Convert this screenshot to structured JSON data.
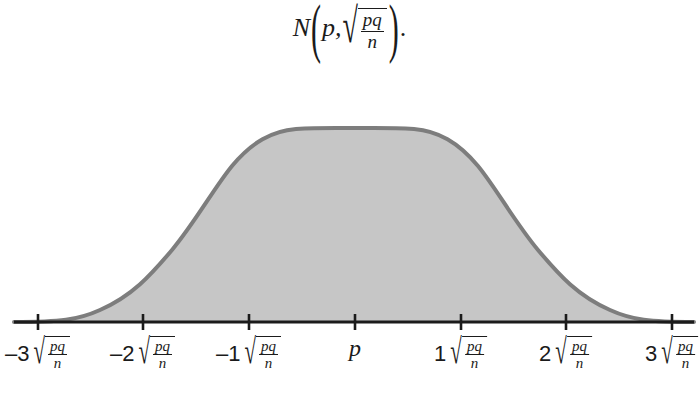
{
  "figure": {
    "background_color": "#ffffff",
    "title": {
      "name": "normal-distribution-notation",
      "text": "N(p, sqrt(pq/n)).",
      "parts": {
        "dist_symbol": "N",
        "open_paren": "(",
        "mean": "p",
        "comma": ",",
        "radical": "√",
        "sd_numerator": "pq",
        "sd_denominator": "n",
        "close_paren": ")",
        "period": "."
      }
    }
  },
  "chart_data": {
    "type": "area",
    "xlabel": "",
    "ylabel": "",
    "grid": false,
    "legend": null,
    "curve": {
      "name": "normal-density-curve",
      "distribution": "normal",
      "mean_label": "p",
      "sd_label": "√(pq/n)",
      "stroke_color": "#7d7d7d",
      "fill_color": "#c6c6c6",
      "stroke_width": 4,
      "peak_x_px": 355,
      "peak_y_px": 129,
      "baseline_y_px": 322
    },
    "axis": {
      "name": "horizontal-axis",
      "color": "#1b1b1b",
      "y_px": 322,
      "x_start_px": 14,
      "x_end_px": 694,
      "tick_half_height_px": 8
    },
    "x": [
      -3,
      -2,
      -1,
      0,
      1,
      2,
      3
    ],
    "tick_positions_px": [
      38,
      143,
      249,
      355,
      461,
      566,
      672
    ],
    "ticks": [
      {
        "coefficient": "–3",
        "radicand_num": "pq",
        "radicand_den": "n",
        "has_radical": true,
        "x_px": 38,
        "value": -3
      },
      {
        "coefficient": "–2",
        "radicand_num": "pq",
        "radicand_den": "n",
        "has_radical": true,
        "x_px": 143,
        "value": -2
      },
      {
        "coefficient": "–1",
        "radicand_num": "pq",
        "radicand_den": "n",
        "has_radical": true,
        "x_px": 249,
        "value": -1
      },
      {
        "coefficient": "p",
        "radicand_num": "",
        "radicand_den": "",
        "has_radical": false,
        "x_px": 355,
        "value": 0
      },
      {
        "coefficient": "1",
        "radicand_num": "pq",
        "radicand_den": "n",
        "has_radical": true,
        "x_px": 461,
        "value": 1
      },
      {
        "coefficient": "2",
        "radicand_num": "pq",
        "radicand_den": "n",
        "has_radical": true,
        "x_px": 566,
        "value": 2
      },
      {
        "coefficient": "3",
        "radicand_num": "pq",
        "radicand_den": "n",
        "has_radical": true,
        "x_px": 672,
        "value": 3
      }
    ],
    "tick_labels": [
      "–3√(pq/n)",
      "–2√(pq/n)",
      "–1√(pq/n)",
      "p",
      "1√(pq/n)",
      "2√(pq/n)",
      "3√(pq/n)"
    ],
    "density_values_relative": [
      0.011,
      0.135,
      0.607,
      1.0,
      0.607,
      0.135,
      0.011
    ],
    "xlim": [
      -3.2,
      3.2
    ],
    "ylim": [
      0,
      1.05
    ]
  }
}
